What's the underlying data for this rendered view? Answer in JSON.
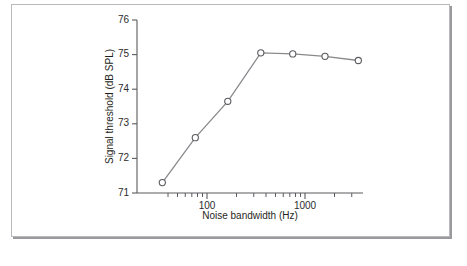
{
  "figure": {
    "background": "#ffffff",
    "frame_color": "#b9b9bc",
    "shadow_color": "#9a9a9e",
    "line_color": "#8a8a8e",
    "axis_color": "#5b5b5f",
    "text_color": "#1f1f21"
  },
  "chart_data": {
    "type": "line",
    "title": "",
    "xlabel": "Noise bandwidth (Hz)",
    "ylabel": "Signal threshold (dB SPL)",
    "xscale": "log",
    "yscale": "linear",
    "xlim": [
      35,
      3900
    ],
    "ylim": [
      71,
      76
    ],
    "grid": false,
    "legend": null,
    "x_tick_labels": [
      "100",
      "1000"
    ],
    "x_tick_values": [
      100,
      1000
    ],
    "x_minor_tick_values": [
      40,
      50,
      60,
      70,
      80,
      90,
      200,
      300,
      400,
      500,
      600,
      700,
      800,
      900,
      2000,
      3000
    ],
    "y_tick_labels": [
      "71",
      "72",
      "73",
      "74",
      "75",
      "76"
    ],
    "y_tick_values": [
      71,
      72,
      73,
      74,
      75,
      76
    ],
    "series": [
      {
        "name": "signal threshold",
        "marker": "open-circle",
        "x": [
          35,
          76,
          163,
          354,
          750,
          1600,
          3500
        ],
        "y": [
          71.3,
          72.6,
          73.65,
          75.05,
          75.02,
          74.95,
          74.83
        ]
      }
    ],
    "annotations": []
  }
}
